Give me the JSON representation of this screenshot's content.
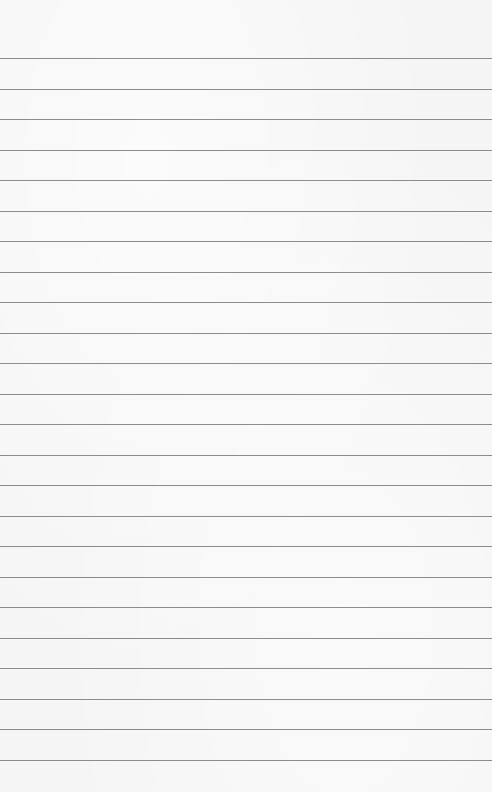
{
  "paper": {
    "background": "#f5f5f5",
    "line_color": "#8c8c8c",
    "first_line_y": 58,
    "line_spacing": 30.5,
    "line_count": 24
  }
}
